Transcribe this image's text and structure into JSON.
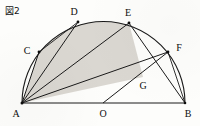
{
  "figure": {
    "caption": "図2",
    "stroke_color": "#1a1a1a",
    "shade_color": "#d8d5cf",
    "background_color": "#fdfdfb"
  },
  "points": [
    {
      "id": "A",
      "label": "A",
      "x": 22,
      "y": 103,
      "label_x": 16,
      "label_y": 117,
      "on": "diameter-left-end"
    },
    {
      "id": "B",
      "label": "B",
      "x": 185,
      "y": 103,
      "label_x": 186,
      "label_y": 117,
      "on": "diameter-right-end"
    },
    {
      "id": "O",
      "label": "O",
      "x": 103,
      "y": 103,
      "label_x": 99,
      "label_y": 117,
      "on": "center"
    },
    {
      "id": "C",
      "label": "C",
      "x": 39,
      "y": 52,
      "label_x": 25,
      "label_y": 51,
      "on": "arc"
    },
    {
      "id": "D",
      "label": "D",
      "x": 78,
      "y": 22,
      "label_x": 72,
      "label_y": 14,
      "on": "arc"
    },
    {
      "id": "E",
      "label": "E",
      "x": 129,
      "y": 23,
      "label_x": 126,
      "label_y": 15,
      "on": "arc"
    },
    {
      "id": "F",
      "label": "F",
      "x": 168,
      "y": 52,
      "label_x": 176,
      "label_y": 50,
      "on": "arc"
    },
    {
      "id": "G",
      "label": "G",
      "x": 143,
      "y": 77,
      "label_x": 140,
      "label_y": 88,
      "on": "intersection-of-AF-and-EB"
    }
  ],
  "segments": [
    {
      "name": "A-B",
      "from": "A",
      "to": "B"
    },
    {
      "name": "A-C",
      "from": "A",
      "to": "C"
    },
    {
      "name": "A-D",
      "from": "A",
      "to": "D"
    },
    {
      "name": "A-E",
      "from": "A",
      "to": "E"
    },
    {
      "name": "A-F",
      "from": "A",
      "to": "F"
    },
    {
      "name": "C-D",
      "from": "C",
      "to": "D"
    },
    {
      "name": "E-B",
      "from": "E",
      "to": "B"
    },
    {
      "name": "F-B",
      "from": "F",
      "to": "B"
    },
    {
      "name": "O-F",
      "from": "O",
      "to": "F"
    }
  ],
  "arcs": [
    {
      "name": "semicircle-A-to-B",
      "from": "A",
      "to": "B",
      "center": "O",
      "radius": 81.5
    }
  ],
  "shaded_regions": [
    {
      "name": "region-A-C-arc-D",
      "description": "between chord AC, arc CD and chord DA"
    },
    {
      "name": "region-A-D-E-G",
      "description": "band bounded by AD, arc DE, EG and GA"
    }
  ]
}
